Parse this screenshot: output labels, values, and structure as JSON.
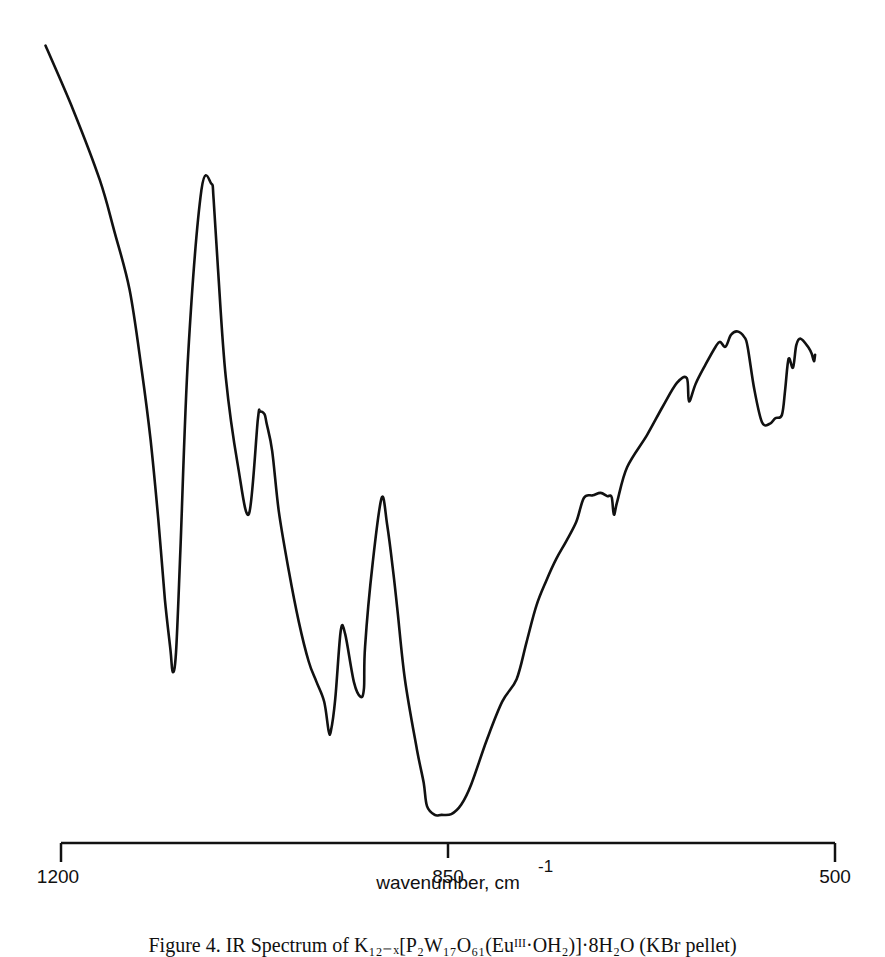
{
  "chart_data": {
    "type": "line",
    "title": "",
    "xlabel": "wavenumber, cm",
    "xlabel_superscript": "-1",
    "ylabel": "",
    "xlim": [
      1200,
      500
    ],
    "x_reversed": true,
    "y_axis_shown": false,
    "ylim_relative": [
      0,
      100
    ],
    "grid": false,
    "legend": null,
    "x_ticks": [
      1200,
      850,
      500
    ],
    "x_tick_labels": [
      "1200",
      "850",
      "500"
    ],
    "series": [
      {
        "name": "IR spectrum (relative transmittance)",
        "x": [
          1214,
          1189,
          1165,
          1152,
          1138,
          1127,
          1119,
          1112,
          1106,
          1101,
          1099,
          1096,
          1092,
          1085,
          1073,
          1064,
          1062,
          1058,
          1051,
          1040,
          1030,
          1022,
          1020,
          1016,
          1014,
          1009,
          1003,
          994,
          985,
          976,
          969,
          962,
          958,
          956,
          952,
          947,
          943,
          935,
          929,
          926,
          925,
          918,
          910,
          905,
          900,
          896,
          889,
          878,
          872,
          869,
          862,
          856,
          847,
          838,
          829,
          815,
          801,
          788,
          779,
          770,
          761,
          752,
          743,
          734,
          727,
          719,
          712,
          706,
          702,
          700,
          697,
          688,
          670,
          656,
          643,
          634,
          632,
          626,
          617,
          608,
          604,
          599,
          594,
          588,
          582,
          579,
          573,
          566,
          559,
          554,
          548,
          545,
          542,
          538,
          535,
          531,
          524,
          521,
          519,
          518
        ],
        "y": [
          99.3,
          91.3,
          82.6,
          76.3,
          68.9,
          58.9,
          50.2,
          40.3,
          30.3,
          24.0,
          21.3,
          23.7,
          36.5,
          60.9,
          81.3,
          82.1,
          80.2,
          71.5,
          58.0,
          47.0,
          41.0,
          52.7,
          53.7,
          53.4,
          52.2,
          48.8,
          41.3,
          33.9,
          27.6,
          22.6,
          20.1,
          17.6,
          14.0,
          13.9,
          17.9,
          26.4,
          26.0,
          20.0,
          18.2,
          19.3,
          24.5,
          35.0,
          43.0,
          39.6,
          34.3,
          29.4,
          20.4,
          11.6,
          7.5,
          4.6,
          3.5,
          3.5,
          3.6,
          4.8,
          7.3,
          12.8,
          17.6,
          20.4,
          25.0,
          29.6,
          32.7,
          35.4,
          37.6,
          40.0,
          43.0,
          43.3,
          43.6,
          43.2,
          43.1,
          40.9,
          42.5,
          46.8,
          50.8,
          54.3,
          57.3,
          57.9,
          55.0,
          57.2,
          59.6,
          61.8,
          62.4,
          61.8,
          63.3,
          63.7,
          63.0,
          61.8,
          56.5,
          52.4,
          52.2,
          52.9,
          53.3,
          56.5,
          60.3,
          59.2,
          62.0,
          62.8,
          61.7,
          60.9,
          60.0,
          60.8
        ]
      }
    ],
    "annotations": {
      "absorption_minima_cm-1": [
        1092,
        956,
        929,
        860,
        523
      ],
      "transmission_maxima_cm-1": [
        1064,
        1020,
        943,
        905,
        577
      ]
    },
    "caption": "Figure 4. IR Spectrum of K₁₂₋ₓ[P₂W₁₇O₆₁(Euᴵᴵᴵ·OH₂)]·8H₂O (KBr pellet)"
  },
  "axis": {
    "tick_labels": [
      "1200",
      "850",
      "500"
    ],
    "xlabel": "wavenumber, cm",
    "xlabel_sup": "-1"
  },
  "caption": {
    "text": "Figure 4. IR Spectrum of K₁₂₋ₓ[P₂W₁₇O₆₁(Euᴵᴵᴵ·OH₂)]·8H₂O (KBr pellet)"
  },
  "colors": {
    "line": "#111111",
    "background": "#ffffff"
  }
}
